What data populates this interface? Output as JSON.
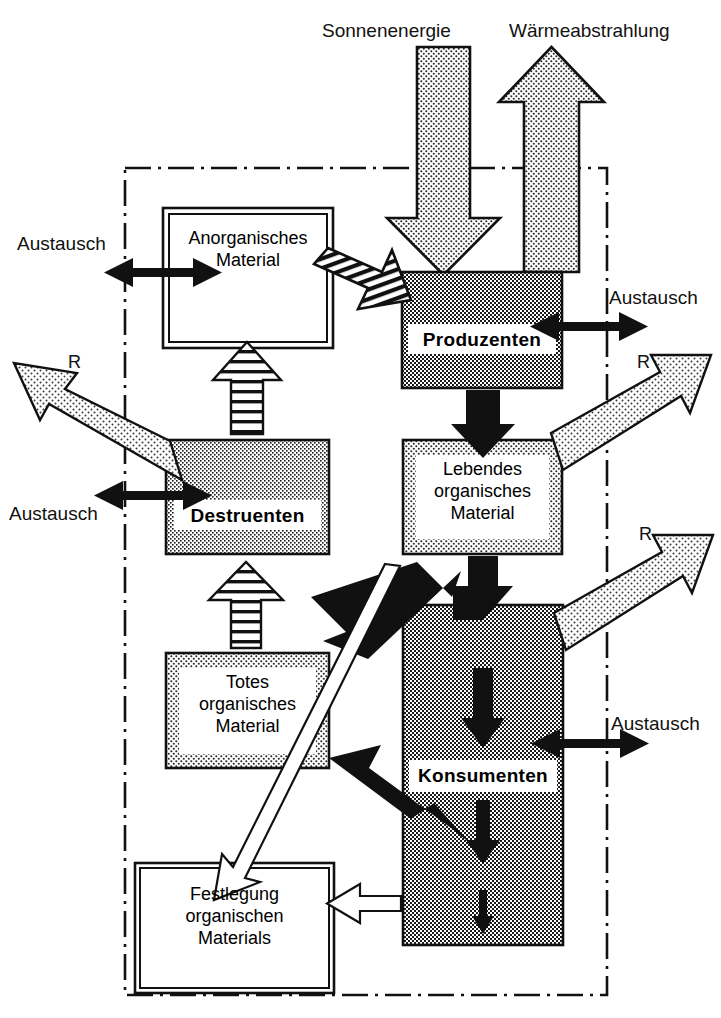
{
  "diagram": {
    "title_top_left": "Sonnenenergie",
    "title_top_right": "Wärmeabstrahlung",
    "boundary_style": "dash-dot",
    "colors": {
      "ink": "#111111",
      "dark_fill": "#8a8a8a",
      "mid_fill": "#b4b4b4",
      "light_fill": "#d9d9d9",
      "pale_fill": "#ececec",
      "white": "#ffffff"
    },
    "boxes": [
      {
        "id": "anorganisches",
        "lines": [
          "Anorganisches",
          "Material"
        ],
        "bold": false,
        "fill": "white",
        "border": "double"
      },
      {
        "id": "produzenten",
        "lines": [
          "Produzenten"
        ],
        "bold": true,
        "fill": "dark",
        "border": "single"
      },
      {
        "id": "destruenten",
        "lines": [
          "Destruenten"
        ],
        "bold": true,
        "fill": "mid",
        "border": "single"
      },
      {
        "id": "lebendes",
        "lines": [
          "Lebendes",
          "organisches",
          "Material"
        ],
        "bold": false,
        "fill": "light",
        "border": "single"
      },
      {
        "id": "totes",
        "lines": [
          "Totes",
          "organisches",
          "Material"
        ],
        "bold": false,
        "fill": "light",
        "border": "single"
      },
      {
        "id": "konsumenten",
        "lines": [
          "Konsumenten"
        ],
        "bold": true,
        "fill": "dark",
        "border": "single"
      },
      {
        "id": "festlegung",
        "lines": [
          "Festlegung",
          "organischen",
          "Materials"
        ],
        "bold": false,
        "fill": "white",
        "border": "double"
      }
    ],
    "exchange_labels": [
      {
        "id": "austausch-anorganisches",
        "text": "Austausch"
      },
      {
        "id": "austausch-produzenten",
        "text": "Austausch"
      },
      {
        "id": "austausch-destruenten",
        "text": "Austausch"
      },
      {
        "id": "austausch-konsumenten",
        "text": "Austausch"
      }
    ],
    "respiration_labels": [
      {
        "id": "r-destruenten",
        "text": "R"
      },
      {
        "id": "r-produzenten",
        "text": "R"
      },
      {
        "id": "r-konsumenten",
        "text": "R"
      }
    ]
  }
}
